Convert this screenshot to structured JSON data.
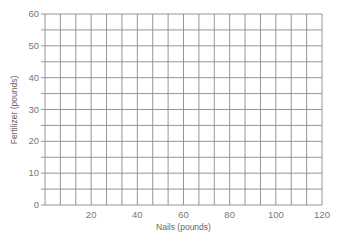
{
  "chart_data": {
    "type": "scatter",
    "title": "",
    "xlabel": "Nails (pounds)",
    "ylabel": "Fertilizer (pounds)",
    "xlim": [
      0,
      120
    ],
    "ylim": [
      0,
      60
    ],
    "x_ticks": [
      20,
      40,
      60,
      80,
      100,
      120
    ],
    "y_ticks": [
      0,
      10,
      20,
      30,
      40,
      50,
      60
    ],
    "x_tick_labels": [
      "20",
      "40",
      "60",
      "80",
      "100",
      "120"
    ],
    "y_tick_labels": [
      "0",
      "10",
      "20",
      "30",
      "40",
      "50",
      "60"
    ],
    "grid": true,
    "grid_columns": 18,
    "grid_rows": 12,
    "series": [],
    "legend": null,
    "note": "Blank graph-paper grid; no data points plotted"
  },
  "colors": {
    "grid": "#8a8a8a",
    "text": "#777777",
    "background": "#ffffff"
  }
}
